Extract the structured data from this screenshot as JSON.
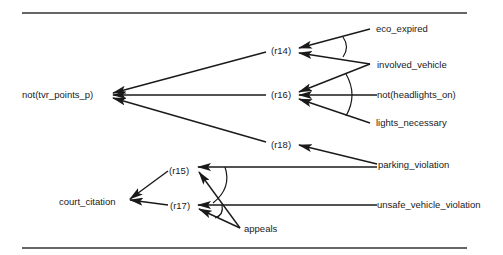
{
  "diagram": {
    "type": "inference-graph",
    "nodes": {
      "not_tvr_points_p": "not(tvr_points_p)",
      "court_citation": "court_citation",
      "r14": "(r14)",
      "r15": "(r15)",
      "r16": "(r16)",
      "r17": "(r17)",
      "r18": "(r18)",
      "eco_expired": "eco_expired",
      "involved_vehicle": "involved_vehicle",
      "not_headlights_on": "not(headlights_on)",
      "lights_necessary": "lights_necessary",
      "parking_violation": "parking_violation",
      "unsafe_vehicle_violation": "unsafe_vehicle_violation",
      "appeals": "appeals"
    },
    "edges": [
      {
        "from": "eco_expired",
        "to": "r14",
        "conjunct_group": "r14"
      },
      {
        "from": "involved_vehicle",
        "to": "r14",
        "conjunct_group": "r14"
      },
      {
        "from": "involved_vehicle",
        "to": "r16",
        "conjunct_group": "r16"
      },
      {
        "from": "not_headlights_on",
        "to": "r16",
        "conjunct_group": "r16"
      },
      {
        "from": "lights_necessary",
        "to": "r16",
        "conjunct_group": "r16"
      },
      {
        "from": "parking_violation",
        "to": "r18"
      },
      {
        "from": "parking_violation",
        "to": "r15",
        "conjunct_group": "r15"
      },
      {
        "from": "appeals",
        "to": "r15",
        "conjunct_group": "r15"
      },
      {
        "from": "unsafe_vehicle_violation",
        "to": "r17",
        "conjunct_group": "r17"
      },
      {
        "from": "appeals",
        "to": "r17",
        "conjunct_group": "r17"
      },
      {
        "from": "r14",
        "to": "not_tvr_points_p"
      },
      {
        "from": "r16",
        "to": "not_tvr_points_p"
      },
      {
        "from": "r18",
        "to": "not_tvr_points_p"
      },
      {
        "from": "r15",
        "to": "court_citation"
      },
      {
        "from": "r17",
        "to": "court_citation"
      }
    ]
  }
}
